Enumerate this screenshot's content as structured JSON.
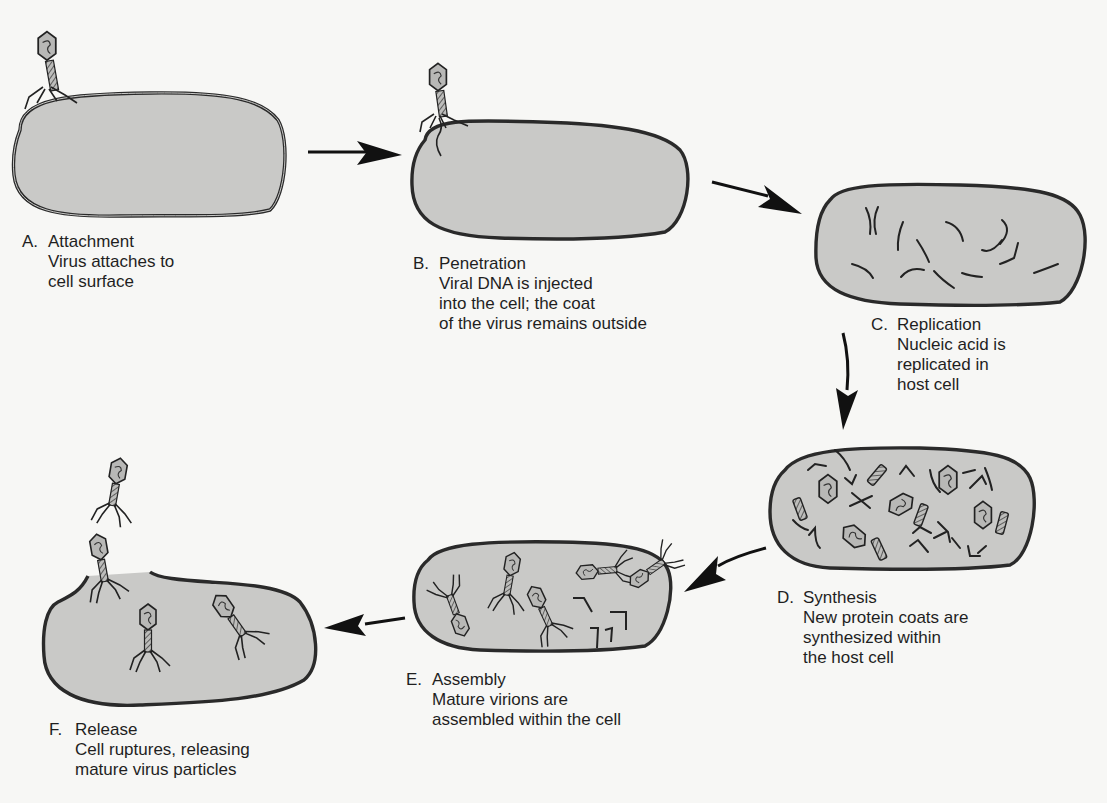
{
  "diagram": {
    "type": "process",
    "colors": {
      "cell_fill": "#c9c9c7",
      "outline": "#2a2a2a",
      "background": "#f7f7f5",
      "capsid_fill": "#b8b8b6"
    },
    "stages": [
      {
        "letter": "A.",
        "title": "Attachment",
        "description": "Virus attaches to\ncell surface"
      },
      {
        "letter": "B.",
        "title": "Penetration",
        "description": "Viral DNA is injected\ninto the cell; the coat\nof the virus remains outside"
      },
      {
        "letter": "C.",
        "title": "Replication",
        "description": "Nucleic acid is\nreplicated in\nhost cell"
      },
      {
        "letter": "D.",
        "title": "Synthesis",
        "description": "New protein coats are\nsynthesized within\nthe host cell"
      },
      {
        "letter": "E.",
        "title": "Assembly",
        "description": "Mature virions are\nassembled within the cell"
      },
      {
        "letter": "F.",
        "title": "Release",
        "description": "Cell ruptures, releasing\nmature virus particles"
      }
    ],
    "flow": [
      "A->B",
      "B->C",
      "C->D",
      "D->E",
      "E->F"
    ]
  }
}
